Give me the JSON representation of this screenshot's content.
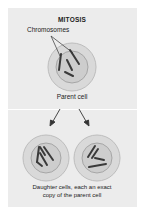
{
  "diagram": {
    "title": "MITOSIS",
    "labels": {
      "chromosomes": "Chromosomes",
      "parent_cell": "Parent cell",
      "daughter_line1": "Daughter cells, each an exact",
      "daughter_line2": "copy of the parent cell"
    },
    "colors": {
      "panel_bg": "#ececec",
      "cell_outer_fill": "#d8d8d8",
      "cell_outer_stroke": "#b9b9b9",
      "nucleus_fill": "#cfcfcf",
      "nucleus_stroke": "#9a9a9a",
      "chromosome": "#3a3a3a",
      "arrow": "#333333"
    },
    "nodes": [
      {
        "id": "parent",
        "label": "Parent cell",
        "chromosomes": 4
      },
      {
        "id": "daughter-left",
        "label": "Daughter cell",
        "chromosomes": 4
      },
      {
        "id": "daughter-right",
        "label": "Daughter cell",
        "chromosomes": 4
      }
    ],
    "edges": [
      {
        "from": "parent",
        "to": "daughter-left"
      },
      {
        "from": "parent",
        "to": "daughter-right"
      }
    ]
  }
}
